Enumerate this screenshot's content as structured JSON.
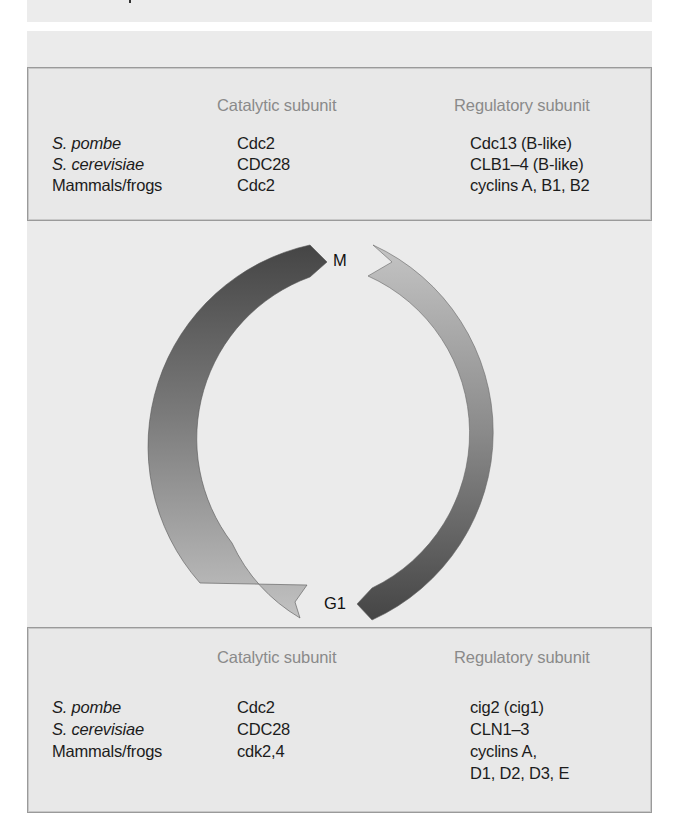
{
  "diagram": {
    "type": "cell-cycle",
    "phases": {
      "top_label": "M",
      "bottom_label": "G1"
    },
    "colors": {
      "background": "#ebebeb",
      "box_border": "#9a9a9a",
      "header_text": "#8a8a8a",
      "body_text": "#1c1c1c",
      "arrow_dark": "#4a4a4a",
      "arrow_light": "#bdbdbd"
    }
  },
  "mitotic_table": {
    "headers": {
      "organism": "",
      "catalytic": "Catalytic  subunit",
      "regulatory": "Regulatory subunit"
    },
    "rows": [
      {
        "organism": "S. pombe",
        "catalytic": "Cdc2",
        "regulatory": "Cdc13 (B-like)"
      },
      {
        "organism": "S. cerevisiae",
        "catalytic": "CDC28",
        "regulatory": "CLB1–4 (B-like)"
      },
      {
        "organism": "Mammals/frogs",
        "catalytic": "Cdc2",
        "regulatory": "cyclins A, B1, B2"
      }
    ]
  },
  "g1_table": {
    "headers": {
      "organism": "",
      "catalytic": "Catalytic  subunit",
      "regulatory": "Regulatory subunit"
    },
    "rows": [
      {
        "organism": "S. pombe",
        "catalytic": "Cdc2",
        "regulatory": "cig2 (cig1)"
      },
      {
        "organism": "S. cerevisiae",
        "catalytic": "CDC28",
        "regulatory": "CLN1–3"
      },
      {
        "organism": "Mammals/frogs",
        "catalytic": "cdk2,4",
        "regulatory": "cyclins A,",
        "regulatory_cont": "D1, D2, D3, E"
      }
    ]
  }
}
